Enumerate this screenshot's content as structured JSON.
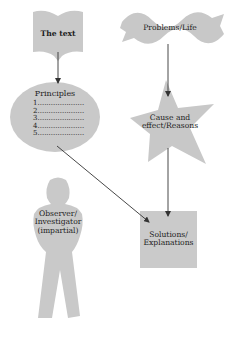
{
  "diagram": {
    "nodes": {
      "text": {
        "label": "The text",
        "shape": "open-book"
      },
      "principles": {
        "title": "Principles",
        "items": [
          "1.....................",
          "2.....................",
          "3.....................",
          "4.....................",
          "5....................."
        ],
        "shape": "ellipse"
      },
      "problems": {
        "label": "Problems/Life",
        "shape": "wave-banner"
      },
      "cause": {
        "line1": "Cause and",
        "line2": "effect/Reasons",
        "shape": "star"
      },
      "solutions": {
        "line1": "Solutions/",
        "line2": "Explanations",
        "shape": "square"
      },
      "observer": {
        "line1": "Observer/",
        "line2": "Investigator",
        "line3": "(impartial)",
        "shape": "person"
      }
    },
    "edges": [
      {
        "from": "The text",
        "to": "Principles"
      },
      {
        "from": "Problems/Life",
        "to": "Cause and effect/Reasons"
      },
      {
        "from": "Cause and effect/Reasons",
        "to": "Solutions/Explanations"
      },
      {
        "from": "Principles",
        "to": "Solutions/Explanations"
      }
    ],
    "colors": {
      "shape_fill": "#c8c8c8",
      "arrow": "#333333",
      "background": "#ffffff"
    }
  }
}
